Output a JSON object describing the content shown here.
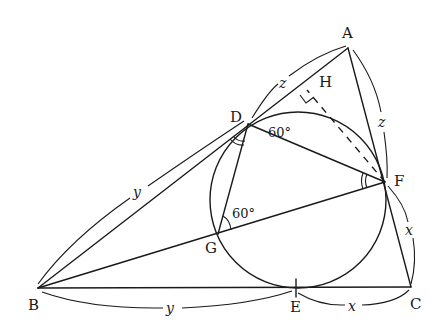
{
  "figure": {
    "points": {
      "A": {
        "label": "A",
        "x": 348,
        "y": 48
      },
      "B": {
        "label": "B",
        "x": 38,
        "y": 288
      },
      "C": {
        "label": "C",
        "x": 411,
        "y": 287
      },
      "D": {
        "label": "D",
        "x": 248,
        "y": 124
      },
      "E": {
        "label": "E",
        "x": 296,
        "y": 288
      },
      "F": {
        "label": "F",
        "x": 385,
        "y": 182
      },
      "G": {
        "label": "G",
        "x": 218,
        "y": 234
      },
      "H": {
        "label": "H",
        "x": 307,
        "y": 90
      }
    },
    "circle": {
      "cx": 298,
      "cy": 200,
      "r": 88
    },
    "segment_labels": {
      "AD": "z",
      "AF": "z",
      "BD": "y",
      "BE": "y",
      "CF": "x",
      "CE": "x"
    },
    "angles": {
      "ADF": "60°",
      "DGF": "60°"
    },
    "markers": {
      "right_angle_at": "H",
      "equal_angles": [
        "BDG",
        "DFG"
      ]
    }
  }
}
